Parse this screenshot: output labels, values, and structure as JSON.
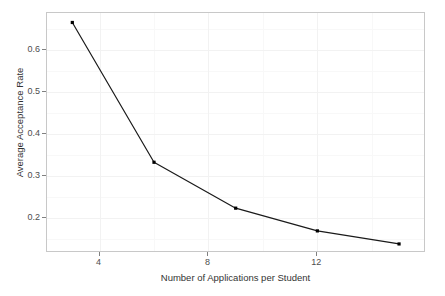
{
  "chart_data": {
    "type": "line",
    "title": "",
    "xlabel": "Number of Applications per Student",
    "ylabel": "Average Acceptance Rate",
    "x": [
      3,
      6,
      9,
      12,
      15
    ],
    "values": [
      0.665,
      0.333,
      0.224,
      0.17,
      0.139
    ],
    "series": [
      {
        "name": "Average Acceptance Rate",
        "x": [
          3,
          6,
          9,
          12,
          15
        ],
        "values": [
          0.665,
          0.333,
          0.224,
          0.17,
          0.139
        ]
      }
    ],
    "xlim": [
      2.07,
      15.99
    ],
    "ylim": [
      0.1175,
      0.6875
    ],
    "xticks": [
      4,
      8,
      12
    ],
    "xtick_labels": [
      "4",
      "8",
      "12"
    ],
    "yticks": [
      0.2,
      0.3,
      0.4,
      0.5,
      0.6
    ],
    "ytick_labels": [
      "0.2",
      "0.3",
      "0.4",
      "0.5",
      "0.6"
    ],
    "x_minor_ticks": [
      2,
      6,
      10,
      14
    ],
    "y_minor_ticks": [
      0.15,
      0.25,
      0.35,
      0.45,
      0.55,
      0.65
    ],
    "grid": true,
    "legend": false,
    "legend_position": "none",
    "line_color": "#1a1a1a",
    "marker": "point",
    "marker_color": "#000000",
    "panel_border_color": "#c8c8c8",
    "grid_major_color": "#f2f2f2",
    "grid_minor_color": "#f8f8f8",
    "background": "#ffffff"
  }
}
